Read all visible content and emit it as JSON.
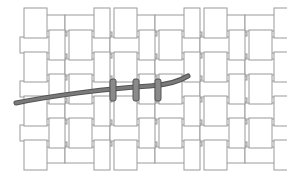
{
  "diagram": {
    "title": "Basket weave with threaded needle",
    "colors": {
      "background": "#ffffff",
      "strip_fill": "#ffffff",
      "strip_stroke": "#9a9a9a",
      "gap_fill": "#dcdcdc",
      "thread": "#7a7a7a",
      "thread_dark": "#555555",
      "stitch": "#8a8a8a"
    },
    "grid": {
      "col_edges": [
        22,
        45,
        62,
        92,
        108,
        138,
        155,
        185,
        200,
        230,
        245,
        275
      ],
      "row_edges": [
        16,
        34,
        56,
        78,
        100,
        122,
        144,
        162
      ],
      "left": 22,
      "right": 275,
      "top": 10,
      "bottom": 170
    },
    "thread": {
      "path": "M16,103 C50,96 110,88 150,86 C168,85 178,82 188,76",
      "width": 5
    },
    "stitches": [
      {
        "x": 110,
        "y": 79,
        "w": 6,
        "h": 22
      },
      {
        "x": 133,
        "y": 79,
        "w": 6,
        "h": 22
      },
      {
        "x": 155,
        "y": 79,
        "w": 6,
        "h": 22
      }
    ]
  }
}
